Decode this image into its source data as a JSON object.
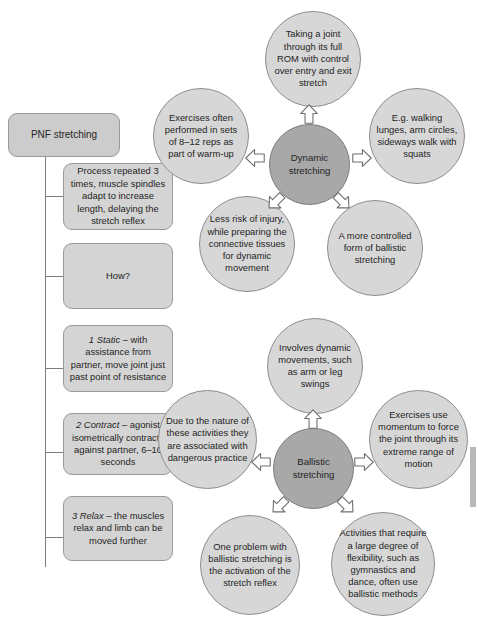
{
  "diagram": {
    "title_box": {
      "label": "PNF stretching"
    },
    "left_branch": [
      {
        "name": "process-repeated",
        "text": "Process repeated 3 times, muscle spindles adapt to increase length, delaying the stretch reflex"
      },
      {
        "name": "how",
        "text": "How?"
      },
      {
        "name": "static",
        "italic": "1 Static",
        "rest": " – with assistance from partner, move joint just past point of resistance"
      },
      {
        "name": "contract",
        "italic": "2 Contract",
        "rest": " – agonist isometrically contracts against partner, 6–10 seconds"
      },
      {
        "name": "relax",
        "italic": "3 Relax",
        "rest": " – the muscles relax and limb can be moved further"
      }
    ],
    "clusters": [
      {
        "name": "dynamic-stretching",
        "hub": "Dynamic stretching",
        "satellites": [
          {
            "name": "dynamic-rom",
            "text": "Taking a joint through its full ROM with control over entry and exit stretch"
          },
          {
            "name": "dynamic-sets-reps",
            "text": "Exercises often performed in sets of 8–12 reps as part of warm-up"
          },
          {
            "name": "dynamic-examples",
            "text": "E.g. walking lunges, arm circles, sideways walk with squats"
          },
          {
            "name": "dynamic-less-risk",
            "text": "Less risk of injury, while preparing the connective tissues for dynamic movement"
          },
          {
            "name": "dynamic-controlled-ballistic",
            "text": "A more controlled form of ballistic stretching"
          }
        ]
      },
      {
        "name": "ballistic-stretching",
        "hub": "Ballistic stretching",
        "satellites": [
          {
            "name": "ballistic-swings",
            "text": "Involves dynamic movements, such as arm or leg swings"
          },
          {
            "name": "ballistic-dangerous",
            "text": "Due to the nature of these activities they are associated with dangerous practice"
          },
          {
            "name": "ballistic-momentum",
            "text": "Exercises use momentum to force the joint through its extreme range of motion"
          },
          {
            "name": "ballistic-stretch-reflex",
            "text": "One problem with ballistic stretching is the activation of the stretch reflex"
          },
          {
            "name": "ballistic-flexibility",
            "text": "Activities that require a large degree of flexibility, such as gymnastics and dance, often use ballistic methods"
          }
        ]
      }
    ],
    "colors": {
      "node_fill": "#d7d7d7",
      "hub_fill": "#a8a8a8",
      "box_fill": "#d4d4d4",
      "stroke": "#8e8e8e",
      "text": "#242424"
    }
  }
}
